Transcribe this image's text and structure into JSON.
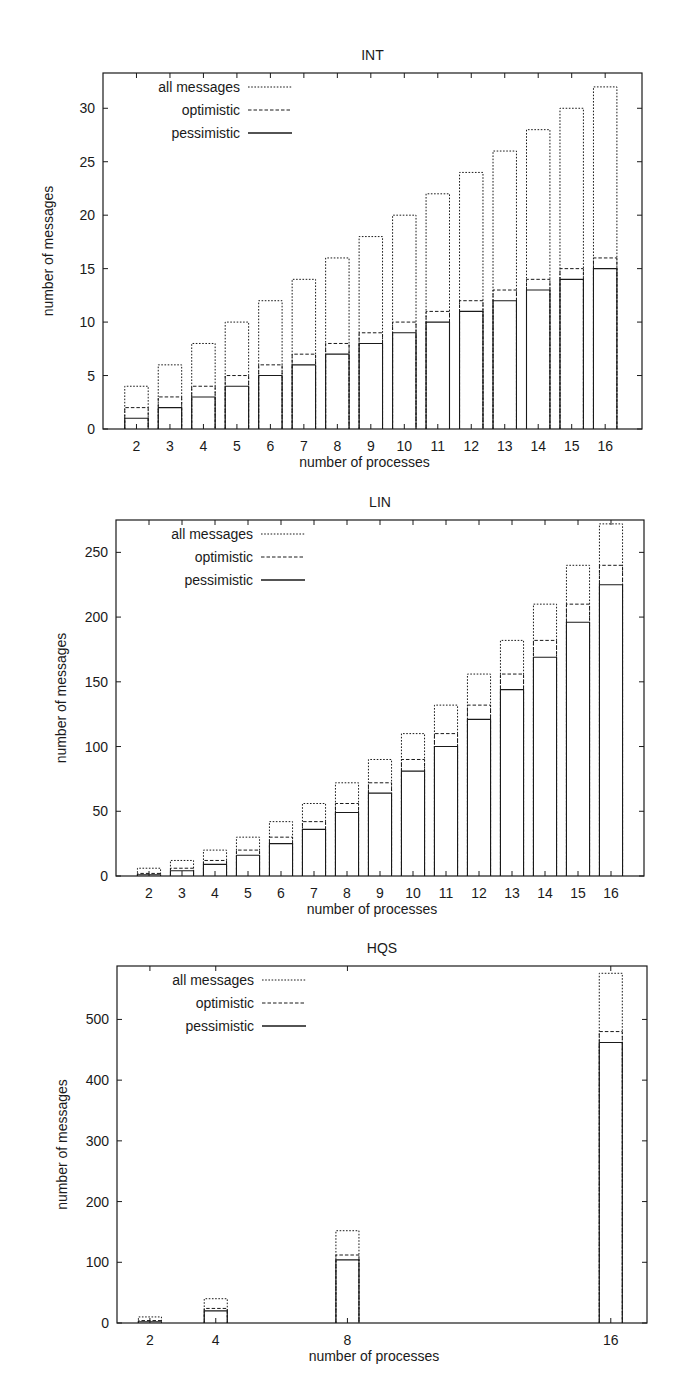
{
  "chart_data": [
    {
      "type": "bar",
      "title": "INT",
      "xlabel": "number of processes",
      "ylabel": "number of messages",
      "categories": [
        2,
        3,
        4,
        5,
        6,
        7,
        8,
        9,
        10,
        11,
        12,
        13,
        14,
        15,
        16
      ],
      "series": [
        {
          "name": "all messages",
          "style": "dotted",
          "values": [
            4,
            6,
            8,
            10,
            12,
            14,
            16,
            18,
            20,
            22,
            24,
            26,
            28,
            30,
            32
          ]
        },
        {
          "name": "optimistic",
          "style": "dashed",
          "values": [
            2,
            3,
            4,
            5,
            6,
            7,
            8,
            9,
            10,
            11,
            12,
            13,
            14,
            15,
            16
          ]
        },
        {
          "name": "pessimistic",
          "style": "solid",
          "values": [
            1,
            2,
            3,
            4,
            5,
            6,
            7,
            8,
            9,
            10,
            11,
            12,
            13,
            14,
            15
          ]
        }
      ],
      "yticks": [
        0,
        5,
        10,
        15,
        20,
        25,
        30
      ],
      "ylim": [
        0,
        33.3
      ],
      "xlim": [
        1,
        17.1
      ],
      "grid": false,
      "legend_position": "upper left",
      "frame": {
        "left": 103,
        "top": 73,
        "right": 642,
        "bottom": 429
      },
      "bar_width": 0.7
    },
    {
      "type": "bar",
      "title": "LIN",
      "xlabel": "number of processes",
      "ylabel": "number of messages",
      "categories": [
        2,
        3,
        4,
        5,
        6,
        7,
        8,
        9,
        10,
        11,
        12,
        13,
        14,
        15,
        16
      ],
      "series": [
        {
          "name": "all messages",
          "style": "dotted",
          "values": [
            6,
            12,
            20,
            30,
            42,
            56,
            72,
            90,
            110,
            132,
            156,
            182,
            210,
            240,
            272
          ]
        },
        {
          "name": "optimistic",
          "style": "dashed",
          "values": [
            2,
            6,
            12,
            20,
            30,
            42,
            56,
            72,
            90,
            110,
            132,
            156,
            182,
            210,
            240
          ]
        },
        {
          "name": "pessimistic",
          "style": "solid",
          "values": [
            1,
            4,
            9,
            16,
            25,
            36,
            49,
            64,
            81,
            100,
            121,
            144,
            169,
            196,
            225
          ]
        }
      ],
      "yticks": [
        0,
        50,
        100,
        150,
        200,
        250
      ],
      "ylim": [
        0,
        275
      ],
      "xlim": [
        1,
        17
      ],
      "grid": false,
      "legend_position": "upper left",
      "frame": {
        "left": 116,
        "top": 520,
        "right": 644,
        "bottom": 876
      },
      "bar_width": 0.7
    },
    {
      "type": "bar",
      "title": "HQS",
      "xlabel": "number of processes",
      "ylabel": "number of messages",
      "categories": [
        2,
        4,
        8,
        16
      ],
      "series": [
        {
          "name": "all messages",
          "style": "dotted",
          "values": [
            10,
            40,
            152,
            576
          ]
        },
        {
          "name": "optimistic",
          "style": "dashed",
          "values": [
            4,
            24,
            112,
            480
          ]
        },
        {
          "name": "pessimistic",
          "style": "solid",
          "values": [
            2,
            20,
            104,
            462
          ]
        }
      ],
      "yticks": [
        0,
        100,
        200,
        300,
        400,
        500
      ],
      "ylim": [
        0,
        588
      ],
      "xlim": [
        1,
        17.1
      ],
      "grid": false,
      "legend_position": "upper left",
      "frame": {
        "left": 117,
        "top": 966,
        "right": 647,
        "bottom": 1323
      },
      "bar_width": 0.7
    }
  ],
  "legend": {
    "all": "all messages",
    "optimistic": "optimistic",
    "pessimistic": "pessimistic"
  },
  "colors": {
    "ink": "#1a1a1a",
    "background": "#ffffff"
  }
}
